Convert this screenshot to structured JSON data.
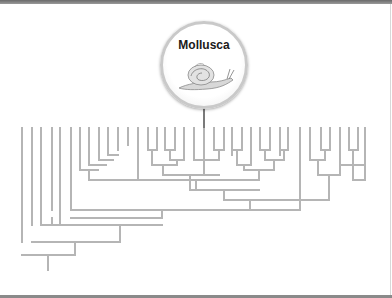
{
  "diagram": {
    "type": "cladogram",
    "highlight": {
      "label": "Mollusca",
      "icon": "snail-icon",
      "attached_leaf_x": 204
    },
    "colors": {
      "branch": "#b5b5b5",
      "badge_border": "#c9c9c9",
      "label": "#1a1a1a"
    },
    "leaf_top_y": 128,
    "leaves_x": [
      22,
      32,
      41,
      52,
      60,
      71,
      80,
      89,
      99,
      108,
      118,
      128,
      138,
      148,
      157,
      165,
      175,
      184,
      194,
      204,
      214,
      224,
      232,
      242,
      251,
      260,
      270,
      280,
      288,
      300,
      310,
      321,
      330,
      340,
      349,
      358
    ],
    "segments": [
      [
        22,
        128,
        22,
        242
      ],
      [
        32,
        128,
        32,
        225
      ],
      [
        41,
        128,
        41,
        210
      ],
      [
        52,
        128,
        52,
        210
      ],
      [
        60,
        128,
        60,
        210
      ],
      [
        71,
        128,
        71,
        192
      ],
      [
        80,
        128,
        80,
        170
      ],
      [
        89,
        128,
        89,
        165
      ],
      [
        99,
        128,
        99,
        160
      ],
      [
        108,
        128,
        108,
        155
      ],
      [
        118,
        128,
        118,
        150
      ],
      [
        128,
        128,
        128,
        145
      ],
      [
        138,
        128,
        138,
        180
      ],
      [
        108,
        155,
        118,
        155
      ],
      [
        99,
        160,
        113,
        160
      ],
      [
        89,
        165,
        106,
        165
      ],
      [
        80,
        170,
        98,
        170
      ],
      [
        89,
        170,
        89,
        180
      ],
      [
        89,
        180,
        138,
        180
      ],
      [
        148,
        128,
        148,
        150
      ],
      [
        157,
        128,
        157,
        150
      ],
      [
        148,
        150,
        157,
        150
      ],
      [
        152,
        150,
        152,
        165
      ],
      [
        165,
        128,
        165,
        150
      ],
      [
        175,
        128,
        175,
        150
      ],
      [
        165,
        150,
        175,
        150
      ],
      [
        170,
        150,
        170,
        160
      ],
      [
        184,
        128,
        184,
        160
      ],
      [
        170,
        160,
        184,
        160
      ],
      [
        177,
        160,
        177,
        165
      ],
      [
        152,
        165,
        177,
        165
      ],
      [
        163,
        165,
        163,
        175
      ],
      [
        194,
        128,
        194,
        150
      ],
      [
        204,
        128,
        204,
        175
      ],
      [
        214,
        128,
        214,
        150
      ],
      [
        224,
        128,
        224,
        150
      ],
      [
        214,
        150,
        224,
        150
      ],
      [
        219,
        150,
        219,
        160
      ],
      [
        194,
        150,
        194,
        160
      ],
      [
        194,
        160,
        219,
        160
      ],
      [
        163,
        175,
        219,
        175
      ],
      [
        190,
        175,
        190,
        190
      ],
      [
        232,
        128,
        232,
        155
      ],
      [
        242,
        128,
        242,
        150
      ],
      [
        232,
        150,
        242,
        150
      ],
      [
        237,
        150,
        237,
        165
      ],
      [
        251,
        128,
        251,
        165
      ],
      [
        260,
        128,
        260,
        150
      ],
      [
        270,
        128,
        270,
        150
      ],
      [
        260,
        150,
        270,
        150
      ],
      [
        265,
        150,
        265,
        160
      ],
      [
        280,
        128,
        280,
        155
      ],
      [
        288,
        128,
        288,
        150
      ],
      [
        280,
        150,
        288,
        150
      ],
      [
        284,
        150,
        284,
        160
      ],
      [
        265,
        160,
        284,
        160
      ],
      [
        274,
        160,
        274,
        170
      ],
      [
        237,
        165,
        251,
        165
      ],
      [
        244,
        165,
        244,
        170
      ],
      [
        244,
        170,
        274,
        170
      ],
      [
        259,
        170,
        259,
        180
      ],
      [
        300,
        128,
        300,
        200
      ],
      [
        310,
        128,
        310,
        160
      ],
      [
        321,
        128,
        321,
        150
      ],
      [
        330,
        128,
        330,
        150
      ],
      [
        321,
        150,
        330,
        150
      ],
      [
        325,
        150,
        325,
        160
      ],
      [
        310,
        160,
        325,
        160
      ],
      [
        318,
        160,
        318,
        175
      ],
      [
        340,
        128,
        340,
        175
      ],
      [
        318,
        175,
        340,
        175
      ],
      [
        329,
        175,
        329,
        200
      ],
      [
        138,
        180,
        259,
        180
      ],
      [
        196,
        180,
        196,
        190
      ],
      [
        190,
        190,
        259,
        190
      ],
      [
        224,
        190,
        224,
        200
      ],
      [
        224,
        200,
        329,
        200
      ],
      [
        250,
        200,
        250,
        210
      ],
      [
        71,
        192,
        71,
        210
      ],
      [
        71,
        210,
        250,
        210
      ],
      [
        300,
        200,
        300,
        210
      ],
      [
        250,
        210,
        300,
        210
      ],
      [
        162,
        210,
        162,
        218
      ],
      [
        71,
        218,
        162,
        218
      ],
      [
        52,
        218,
        52,
        225
      ],
      [
        41,
        210,
        41,
        225
      ],
      [
        60,
        210,
        60,
        225
      ],
      [
        41,
        225,
        162,
        225
      ],
      [
        120,
        225,
        120,
        242
      ],
      [
        32,
        242,
        120,
        242
      ],
      [
        75,
        242,
        75,
        255
      ],
      [
        22,
        255,
        75,
        255
      ],
      [
        48,
        255,
        48,
        270
      ],
      [
        358,
        128,
        358,
        150
      ],
      [
        349,
        128,
        349,
        150
      ],
      [
        349,
        150,
        358,
        150
      ],
      [
        353,
        150,
        353,
        165
      ],
      [
        365,
        128,
        365,
        180
      ],
      [
        340,
        165,
        365,
        165
      ],
      [
        353,
        165,
        353,
        180
      ],
      [
        353,
        180,
        365,
        180
      ]
    ]
  }
}
